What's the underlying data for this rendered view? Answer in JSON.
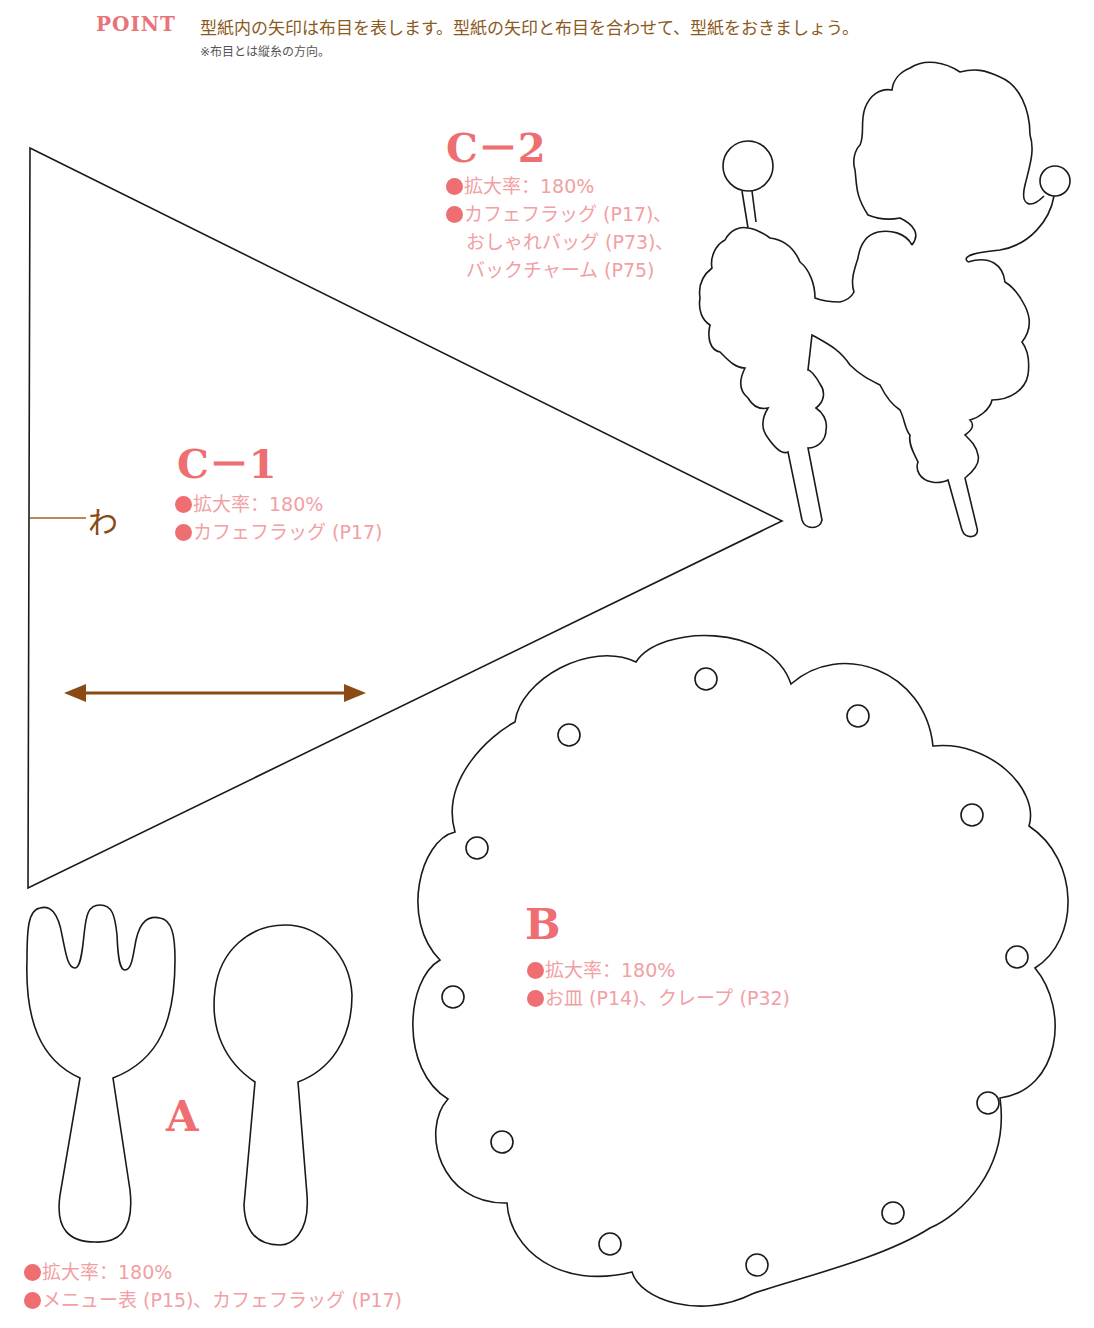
{
  "header": {
    "point_label": "POINT",
    "point_text": "型紙内の矢印は布目を表します。型紙の矢印と布目を合わせて、型紙をおきましょう。",
    "point_note": "※布目とは縦糸の方向。"
  },
  "pieces": {
    "c2": {
      "title": "C－2",
      "lines": [
        "拡大率：180%",
        "カフェフラッグ (P17)、",
        "おしゃれバッグ (P73)、",
        "バックチャーム (P75)"
      ],
      "shape": "poodle"
    },
    "c1": {
      "title": "C－1",
      "lines": [
        "拡大率：180%",
        "カフェフラッグ (P17)"
      ],
      "shape": "triangle-flag",
      "fold_label": "わ",
      "grain_arrow": "double-headed-arrow"
    },
    "b": {
      "title": "B",
      "lines": [
        "拡大率：180%",
        "お皿 (P14)、クレープ (P32)"
      ],
      "shape": "scalloped-plate"
    },
    "a": {
      "title": "A",
      "lines": [
        "拡大率：180%",
        "メニュー表 (P15)、カフェフラッグ (P17)"
      ],
      "shapes": [
        "fork",
        "spoon"
      ]
    }
  },
  "colors": {
    "accent_pink": "#ee6e72",
    "light_pink_text": "#f2a0a3",
    "brown": "#8a4a14",
    "outline": "#1a1a1a"
  }
}
